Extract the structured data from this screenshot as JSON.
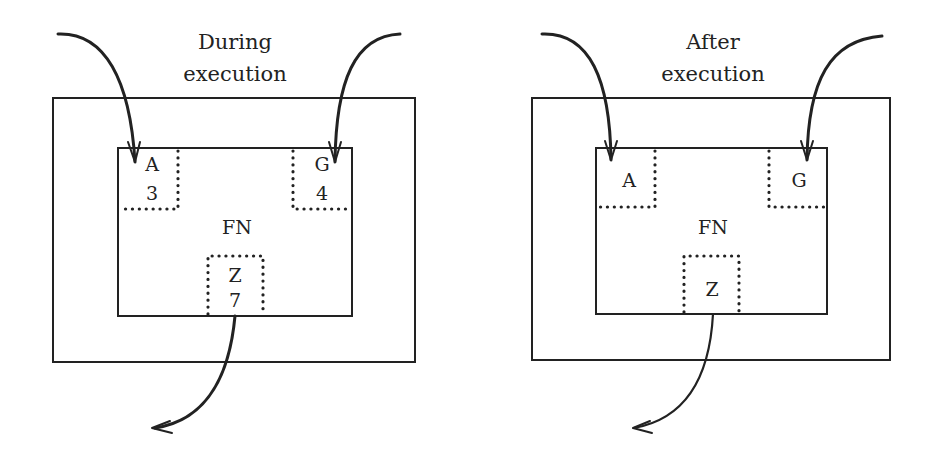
{
  "panels": [
    {
      "title_line1": "During",
      "title_line2": "execution",
      "function_label": "FN",
      "slots": {
        "a": {
          "name": "A",
          "value": "3"
        },
        "g": {
          "name": "G",
          "value": "4"
        },
        "z": {
          "name": "Z",
          "value": "7"
        }
      }
    },
    {
      "title_line1": "After",
      "title_line2": "execution",
      "function_label": "FN",
      "slots": {
        "a": {
          "name": "A",
          "value": ""
        },
        "g": {
          "name": "G",
          "value": ""
        },
        "z": {
          "name": "Z",
          "value": ""
        }
      }
    }
  ],
  "colors": {
    "ink": "#222222",
    "background": "#ffffff"
  }
}
